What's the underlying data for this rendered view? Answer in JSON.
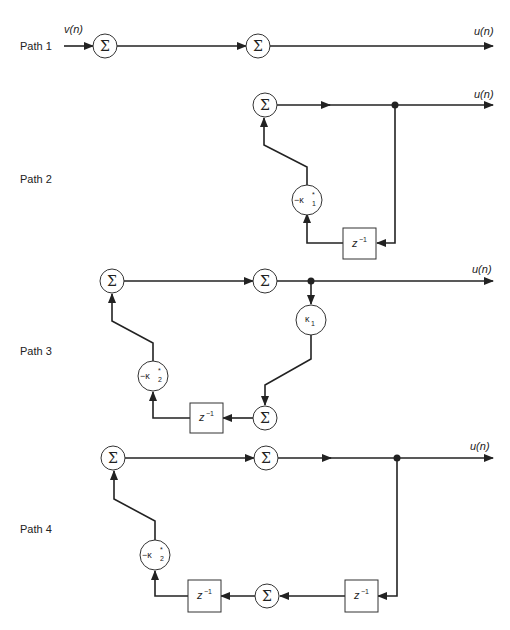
{
  "diagram": {
    "type": "signal-flow-graph",
    "paths": [
      {
        "label": "Path 1",
        "input_label": "v(n)",
        "output_label": "u(n)",
        "nodes": [
          "sum",
          "sum"
        ]
      },
      {
        "label": "Path 2",
        "output_label": "u(n)",
        "nodes": [
          "sum",
          "-κ1*",
          "z^-1"
        ]
      },
      {
        "label": "Path 3",
        "output_label": "u(n)",
        "nodes": [
          "sum",
          "sum",
          "κ1",
          "sum",
          "z^-1",
          "-κ2*"
        ]
      },
      {
        "label": "Path 4",
        "output_label": "u(n)",
        "nodes": [
          "sum",
          "sum",
          "z^-1",
          "sum",
          "z^-1",
          "-κ2*"
        ]
      }
    ],
    "symbols": {
      "sum": "Σ",
      "delay_base": "z",
      "delay_exp": "−1",
      "neg": "−κ",
      "kappa": "κ",
      "conj": "*",
      "sub1": "1",
      "sub2": "2"
    },
    "colors": {
      "line": "#222222",
      "node_fill": "#ffffff",
      "background": "#ffffff"
    }
  }
}
